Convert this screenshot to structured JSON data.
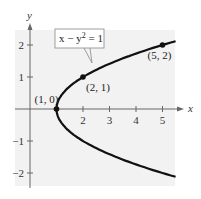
{
  "chart_data": {
    "type": "line",
    "title": "",
    "xlabel": "x",
    "ylabel": "y",
    "xlim": [
      -0.5,
      5.5
    ],
    "ylim": [
      -2.5,
      2.5
    ],
    "x_ticks": [
      2,
      3,
      4,
      5
    ],
    "y_ticks": [
      -2,
      -1,
      1,
      2
    ],
    "grid": false,
    "series": [
      {
        "name": "x - y^2 = 1",
        "equation": "x = 1 + y^2",
        "y_range": [
          -2.12,
          2.12
        ]
      }
    ],
    "points": [
      {
        "x": 1,
        "y": 0,
        "label": "(1, 0)"
      },
      {
        "x": 2,
        "y": 1,
        "label": "(2, 1)"
      },
      {
        "x": 5,
        "y": 2,
        "label": "(5, 2)"
      }
    ],
    "annotation": {
      "text_main": "x − y",
      "text_sup": "2",
      "text_tail": " = 1"
    }
  },
  "colors": {
    "background": "#f2f2f2",
    "curve": "#111111",
    "axis": "#666666"
  }
}
